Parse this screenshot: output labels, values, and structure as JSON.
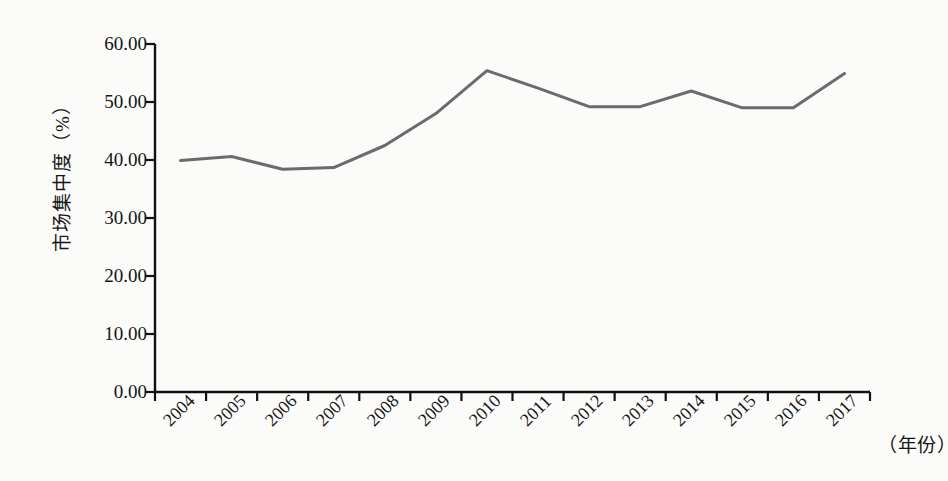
{
  "chart_data": {
    "type": "line",
    "title": "",
    "xlabel": "（年份）",
    "ylabel": "市场集中度（%）",
    "categories": [
      "2004",
      "2005",
      "2006",
      "2007",
      "2008",
      "2009",
      "2010",
      "2011",
      "2012",
      "2013",
      "2014",
      "2015",
      "2016",
      "2017"
    ],
    "values": [
      39.9,
      40.6,
      38.4,
      38.7,
      42.5,
      48.0,
      55.4,
      52.4,
      49.2,
      49.2,
      51.9,
      49.0,
      49.0,
      54.9
    ],
    "series": [
      {
        "name": "市场集中度",
        "values": [
          39.9,
          40.6,
          38.4,
          38.7,
          42.5,
          48.0,
          55.4,
          52.4,
          49.2,
          49.2,
          51.9,
          49.0,
          49.0,
          54.9
        ],
        "color": "#6b6b6b"
      }
    ],
    "ylim": [
      0,
      60
    ],
    "ytick_step": 10,
    "ytick_labels": [
      "60.00",
      "50.00",
      "40.00",
      "30.00",
      "20.00",
      "10.00",
      "0.00"
    ],
    "ytick_values": [
      60,
      50,
      40,
      30,
      20,
      10,
      0
    ],
    "grid": false,
    "legend": "none",
    "axis_color": "#111111",
    "background": "#fbfbf9",
    "xtick_label_rotation": -45
  }
}
